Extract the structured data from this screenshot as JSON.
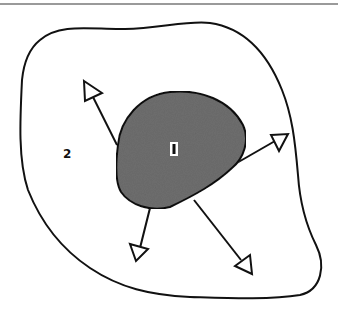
{
  "diagram": {
    "regions": [
      {
        "id": "inner",
        "label": "1",
        "fill": "#6e6e6e"
      },
      {
        "id": "outer",
        "label": "2",
        "fill": "#ffffff"
      }
    ],
    "arrows": [
      {
        "direction": "up-left"
      },
      {
        "direction": "right"
      },
      {
        "direction": "down-left"
      },
      {
        "direction": "down-right"
      }
    ],
    "colors": {
      "stroke": "#111111",
      "inner_fill": "#6e6e6e",
      "header_rule": "#9a9a9a"
    }
  }
}
